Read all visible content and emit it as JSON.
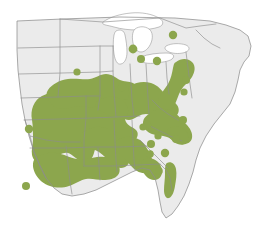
{
  "figure": {
    "kind": "species-range-map",
    "region": "Eastern United States",
    "background_color": "#ffffff",
    "land_color": "#ebebeb",
    "water_color": "#ffffff",
    "border_color": "#8d8d8d",
    "range_color": "#8ca64d",
    "title": "",
    "caption": "",
    "legend": []
  },
  "layers": {
    "land": {
      "name": "United States landmass",
      "path": "M44 28 L44 24 L118 20 L205 22 L231 30 L243 44 L249 64 L251 86 L243 104 L236 120 L231 140 L224 158 L214 172 L204 186 L196 200 L188 214 L176 224 L166 220 L160 206 L156 190 L150 176 L140 172 L126 178 L110 186 L94 192 L80 196 L66 196 L54 190 L44 180 L36 166 L30 150 L24 132 L20 112 L18 92 L16 70 L16 48 Z"
    },
    "lakes": [
      {
        "name": "Lake Superior",
        "path": "M108 18 L120 14 L140 13 L156 16 L162 22 L154 28 L142 30 L128 31 L116 28 L108 24 Z"
      },
      {
        "name": "Lake Michigan",
        "path": "M117 30 L124 29 L127 38 L128 50 L126 60 L121 63 L117 56 L115 44 Z"
      },
      {
        "name": "Lake Huron",
        "path": "M136 28 L146 27 L152 33 L150 44 L144 52 L138 50 L134 42 L133 34 Z"
      },
      {
        "name": "Lake Erie",
        "path": "M142 56 L158 54 L168 53 L170 57 L160 61 L148 62 L142 60 Z"
      },
      {
        "name": "Lake Ontario",
        "path": "M168 46 L182 44 L188 46 L186 51 L176 53 L168 51 Z"
      }
    ],
    "range_polygons": [
      {
        "name": "ozark-mid-south-core"
      },
      {
        "name": "central-appalachian-band"
      },
      {
        "name": "gulf-coastal-plain"
      },
      {
        "name": "piedmont-carolinas"
      },
      {
        "name": "florida-panhandle-strip"
      },
      {
        "name": "north-florida-west-coast"
      }
    ],
    "outlier_dots": [
      {
        "name": "west-texas-outlier",
        "cx": 29,
        "cy": 129,
        "r": 4.2
      },
      {
        "name": "southwest-texas-outlier",
        "cx": 26,
        "cy": 186,
        "r": 4.0
      },
      {
        "name": "iowa-outlier",
        "cx": 77,
        "cy": 72,
        "r": 3.6
      },
      {
        "name": "missouri-outlier",
        "cx": 122,
        "cy": 87,
        "r": 4.2
      },
      {
        "name": "michigan-lower-outlier",
        "cx": 133,
        "cy": 49,
        "r": 4.4
      },
      {
        "name": "indiana-ohio-outlier",
        "cx": 141,
        "cy": 59,
        "r": 4.0
      },
      {
        "name": "ohio-outlier",
        "cx": 157,
        "cy": 61,
        "r": 4.2
      },
      {
        "name": "ontario-ny-outlier",
        "cx": 173,
        "cy": 35,
        "r": 4.2
      },
      {
        "name": "pennsylvania-outlier",
        "cx": 186,
        "cy": 80,
        "r": 4.0
      },
      {
        "name": "virginia-outlier",
        "cx": 147,
        "cy": 125,
        "r": 4.4
      },
      {
        "name": "carolina-outlier-1",
        "cx": 151,
        "cy": 144,
        "r": 4.0
      },
      {
        "name": "carolina-outlier-2",
        "cx": 165,
        "cy": 153,
        "r": 4.2
      },
      {
        "name": "carolina-outlier-3",
        "cx": 150,
        "cy": 154,
        "r": 3.8
      },
      {
        "name": "georgia-outlier-1",
        "cx": 158,
        "cy": 136,
        "r": 3.6
      },
      {
        "name": "georgia-outlier-2",
        "cx": 176,
        "cy": 139,
        "r": 4.0
      },
      {
        "name": "sc-coastal-outlier",
        "cx": 183,
        "cy": 120,
        "r": 4.0
      },
      {
        "name": "ga-coastal-outlier",
        "cx": 159,
        "cy": 171,
        "r": 3.8
      },
      {
        "name": "appalachian-outlier",
        "cx": 143,
        "cy": 127,
        "r": 3.6
      },
      {
        "name": "ky-tn-outlier",
        "cx": 184,
        "cy": 92,
        "r": 3.6
      }
    ]
  }
}
